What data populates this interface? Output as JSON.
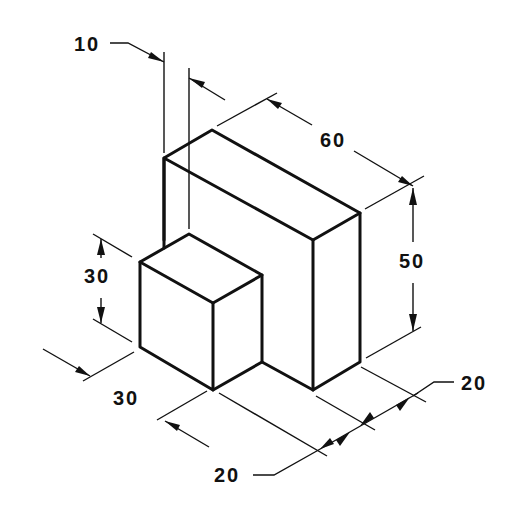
{
  "drawing": {
    "type": "isometric technical drawing",
    "object": "L-shaped block: large block with small cube in front",
    "dimensions": {
      "offset_top": "10",
      "length_top": "60",
      "height_right": "50",
      "cube_height": "30",
      "cube_width": "30",
      "bottom_front": "20",
      "bottom_right": "20"
    }
  }
}
